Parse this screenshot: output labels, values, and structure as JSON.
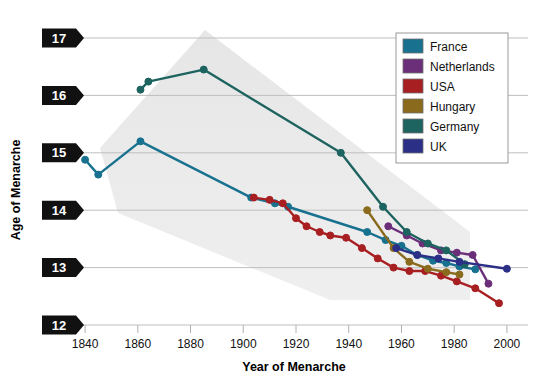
{
  "figure": {
    "number": "Figure 9.4",
    "title": "Trends in Age of Menarche"
  },
  "chart_data": {
    "type": "line",
    "title": "Trends in Age of Menarche",
    "xlabel": "Year of Menarche",
    "ylabel": "Age of Menarche",
    "xlim": [
      1832,
      2008
    ],
    "ylim": [
      12,
      17
    ],
    "xticks": [
      1840,
      1860,
      1880,
      1900,
      1920,
      1940,
      1960,
      1980,
      2000
    ],
    "yticks": [
      12,
      13,
      14,
      15,
      16,
      17
    ],
    "grid": "horizontal",
    "legend_position": "top-right",
    "series": [
      {
        "name": "France",
        "color": "#17718f",
        "points": [
          [
            1840,
            14.88
          ],
          [
            1845,
            14.62
          ],
          [
            1861,
            15.2
          ],
          [
            1903,
            14.22
          ],
          [
            1912,
            14.12
          ],
          [
            1917,
            14.06
          ],
          [
            1947,
            13.62
          ],
          [
            1954,
            13.48
          ],
          [
            1960,
            13.38
          ],
          [
            1966,
            13.22
          ],
          [
            1972,
            13.12
          ],
          [
            1977,
            13.08
          ],
          [
            1982,
            13.02
          ],
          [
            1988,
            12.97
          ]
        ]
      },
      {
        "name": "Netherlands",
        "color": "#6b2f7a",
        "points": [
          [
            1955,
            13.72
          ],
          [
            1962,
            13.56
          ],
          [
            1968,
            13.42
          ],
          [
            1975,
            13.3
          ],
          [
            1981,
            13.26
          ],
          [
            1987,
            13.22
          ],
          [
            1993,
            12.72
          ]
        ]
      },
      {
        "name": "USA",
        "color": "#a81f22",
        "points": [
          [
            1904,
            14.22
          ],
          [
            1910,
            14.18
          ],
          [
            1915,
            14.12
          ],
          [
            1920,
            13.86
          ],
          [
            1924,
            13.72
          ],
          [
            1929,
            13.62
          ],
          [
            1933,
            13.56
          ],
          [
            1939,
            13.52
          ],
          [
            1945,
            13.34
          ],
          [
            1951,
            13.16
          ],
          [
            1957,
            13.0
          ],
          [
            1963,
            12.94
          ],
          [
            1969,
            12.94
          ],
          [
            1975,
            12.86
          ],
          [
            1981,
            12.76
          ],
          [
            1988,
            12.64
          ],
          [
            1997,
            12.38
          ]
        ]
      },
      {
        "name": "Hungary",
        "color": "#8a6a1c",
        "points": [
          [
            1947,
            14.0
          ],
          [
            1957,
            13.34
          ],
          [
            1963,
            13.1
          ],
          [
            1970,
            12.98
          ],
          [
            1977,
            12.92
          ],
          [
            1982,
            12.88
          ]
        ]
      },
      {
        "name": "Germany",
        "color": "#1d6360",
        "points": [
          [
            1861,
            16.1
          ],
          [
            1864,
            16.24
          ],
          [
            1885,
            16.45
          ],
          [
            1937,
            15.0
          ],
          [
            1953,
            14.06
          ],
          [
            1962,
            13.62
          ],
          [
            1970,
            13.42
          ],
          [
            1977,
            13.3
          ],
          [
            1984,
            13.06
          ]
        ]
      },
      {
        "name": "UK",
        "color": "#2b2f86",
        "points": [
          [
            1958,
            13.34
          ],
          [
            1966,
            13.22
          ],
          [
            1974,
            13.16
          ],
          [
            1982,
            13.1
          ],
          [
            2000,
            12.98
          ]
        ]
      }
    ]
  },
  "legend": {
    "items": [
      {
        "label": "France",
        "color": "#17718f"
      },
      {
        "label": "Netherlands",
        "color": "#6b2f7a"
      },
      {
        "label": "USA",
        "color": "#a81f22"
      },
      {
        "label": "Hungary",
        "color": "#8a6a1c"
      },
      {
        "label": "Germany",
        "color": "#1d6360"
      },
      {
        "label": "UK",
        "color": "#2b2f86"
      }
    ]
  }
}
